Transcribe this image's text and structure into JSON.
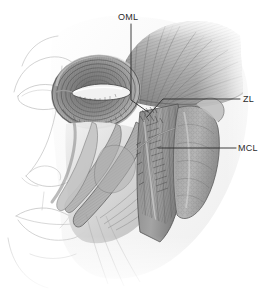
{
  "figure": {
    "style": "grayscale anatomical pencil illustration",
    "background_color": "#ffffff",
    "line_color": "#2b2b2b",
    "view": "left three-quarter oblique of a human face with superficial skin removed over the lateral face",
    "labels": [
      {
        "id": "oml",
        "text": "OML",
        "meaning": "orbitomalar ligament",
        "label_x": 118,
        "label_y": 13,
        "leader": {
          "type": "polyline",
          "points": [
            [
              131,
              24
            ],
            [
              131,
              100
            ],
            [
              148,
              112
            ]
          ]
        }
      },
      {
        "id": "zl",
        "text": "ZL",
        "meaning": "zygomatic ligament",
        "label_x": 243,
        "label_y": 95,
        "leader": {
          "type": "polyline",
          "points": [
            [
              240,
              99
            ],
            [
              163,
              99
            ],
            [
              147,
              117
            ]
          ]
        }
      },
      {
        "id": "mcl",
        "text": "MCL",
        "meaning": "masseteric cutaneous ligament",
        "label_x": 238,
        "label_y": 144,
        "leader": {
          "type": "polyline",
          "points": [
            [
              236,
              148
            ],
            [
              158,
              148
            ]
          ]
        }
      }
    ],
    "structures": [
      {
        "name": "temporalis-muscle",
        "description": "fan of radiating fibers over the temple, upper right"
      },
      {
        "name": "orbicularis-oculi-muscle",
        "description": "concentric elliptical fiber rings encircling the eye"
      },
      {
        "name": "palpebral-fissure",
        "description": "bright eyelid opening at the center of the orbicularis rings"
      },
      {
        "name": "zygomaticus-major-muscle",
        "description": "oblique band running from cheekbone down toward the oral commissure"
      },
      {
        "name": "zygomaticus-minor-muscle",
        "description": "narrow oblique band medial to zygomaticus major"
      },
      {
        "name": "levator-labii-superioris-muscle",
        "description": "flat band descending from the infraorbital rim to the upper lip"
      },
      {
        "name": "masseter-muscle",
        "description": "thick vertically striated quadrangular muscle over the mandibular ramus"
      },
      {
        "name": "parotid-gland",
        "description": "lobulated gland anterior to the ear, right of the masseter"
      },
      {
        "name": "parotid-duct",
        "description": "fine tube crossing the masseter toward the cheek"
      },
      {
        "name": "nose-profile",
        "description": "light outline of nose, nostril and alar rim on the left"
      },
      {
        "name": "lips",
        "description": "light outline of upper and lower lip, lower left"
      },
      {
        "name": "chin-and-jawline",
        "description": "faint contour of chin and mandibular border, lower left"
      },
      {
        "name": "brow-and-forehead",
        "description": "faint contour of brow ridge and forehead, upper left"
      }
    ]
  }
}
